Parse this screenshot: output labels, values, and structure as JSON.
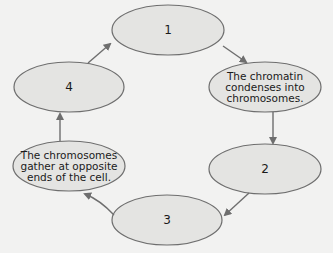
{
  "diagram": {
    "title": "",
    "type": "cycle",
    "colors": {
      "background": "#f2f2f1",
      "node_fill": "#e4e4e2",
      "node_stroke": "#6e6e6e",
      "arrow": "#6e6e6e",
      "text": "#1a1a1a"
    },
    "nodes": [
      {
        "id": "1",
        "label": "1"
      },
      {
        "id": "chromatin",
        "label": "The chromatin\ncondenses into\nchromosomes."
      },
      {
        "id": "2",
        "label": "2"
      },
      {
        "id": "3",
        "label": "3"
      },
      {
        "id": "chromosomes-gather",
        "label": "The chromosomes\ngather at opposite\nends of the cell."
      },
      {
        "id": "4",
        "label": "4"
      }
    ],
    "edges": [
      {
        "from": "1",
        "to": "chromatin"
      },
      {
        "from": "chromatin",
        "to": "2"
      },
      {
        "from": "2",
        "to": "3"
      },
      {
        "from": "3",
        "to": "chromosomes-gather"
      },
      {
        "from": "chromosomes-gather",
        "to": "4"
      },
      {
        "from": "4",
        "to": "1"
      }
    ]
  }
}
